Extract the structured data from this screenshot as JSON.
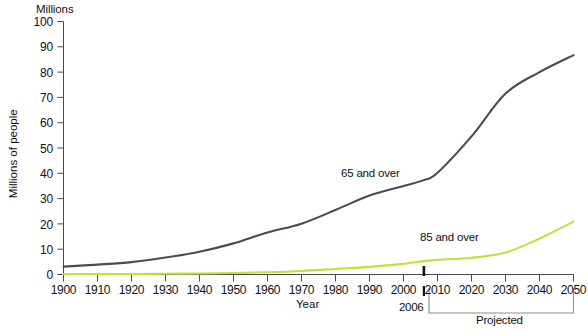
{
  "chart_data": {
    "type": "line",
    "title": "",
    "unit_caption": "Millions",
    "xlabel": "Year",
    "ylabel": "Millions of people",
    "xlim": [
      1900,
      2050
    ],
    "ylim": [
      0,
      100
    ],
    "grid": false,
    "legend_position": "inline-annotation",
    "x_ticks": [
      1900,
      1910,
      1920,
      1930,
      1940,
      1950,
      1960,
      1970,
      1980,
      1990,
      2000,
      2010,
      2020,
      2030,
      2040,
      2050
    ],
    "y_ticks": [
      0,
      10,
      20,
      30,
      40,
      50,
      60,
      70,
      80,
      90,
      100
    ],
    "x": [
      1900,
      1910,
      1920,
      1930,
      1940,
      1950,
      1960,
      1970,
      1980,
      1990,
      2000,
      2006,
      2010,
      2020,
      2030,
      2040,
      2050
    ],
    "series": [
      {
        "name": "65 and over",
        "color": "#4a4a58",
        "values": [
          3.1,
          3.9,
          4.9,
          6.7,
          9.0,
          12.3,
          16.6,
          20.1,
          25.5,
          31.2,
          35.0,
          37.3,
          40.2,
          54.6,
          71.5,
          80.0,
          86.7
        ]
      },
      {
        "name": "85 and over",
        "color": "#c6dd3c",
        "values": [
          0.1,
          0.2,
          0.2,
          0.3,
          0.4,
          0.6,
          0.9,
          1.4,
          2.2,
          3.0,
          4.2,
          5.3,
          5.8,
          6.6,
          8.7,
          14.2,
          20.9
        ]
      }
    ],
    "annotations": [
      {
        "name": "marker-2006",
        "x": 2006,
        "label": "2006"
      },
      {
        "name": "projected-bracket",
        "from": 2006,
        "to": 2050,
        "label": "Projected"
      }
    ]
  },
  "axis": {
    "unit_caption": "Millions",
    "x_title": "Year",
    "y_title": "Millions of people",
    "y_labels": [
      "100",
      "90",
      "80",
      "70",
      "60",
      "50",
      "40",
      "30",
      "20",
      "10",
      "0"
    ],
    "x_labels": [
      "1900",
      "1910",
      "1920",
      "1930",
      "1940",
      "1950",
      "1960",
      "1970",
      "1980",
      "1990",
      "2000",
      "2010",
      "2020",
      "2030",
      "2040",
      "2050"
    ]
  },
  "series_labels": {
    "s65": "65 and over",
    "s85": "85 and over"
  },
  "annotations": {
    "marker_2006": "2006",
    "projected": "Projected"
  }
}
